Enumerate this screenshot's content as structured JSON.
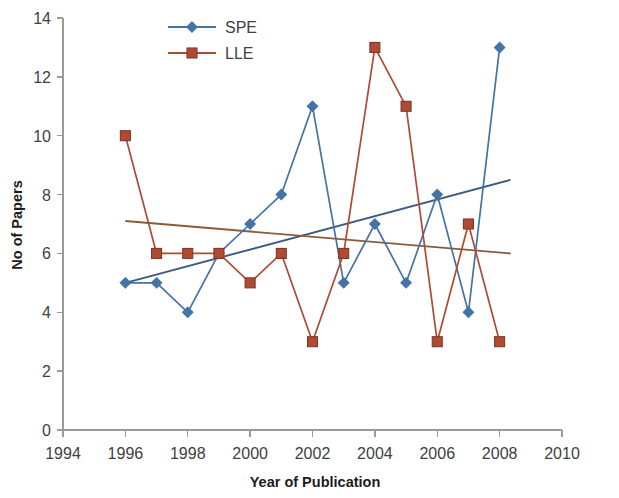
{
  "chart_data": {
    "type": "line",
    "title": "",
    "xlabel": "Year of Publication",
    "ylabel": "No of Papers",
    "x": [
      1996,
      1997,
      1998,
      1999,
      2000,
      2001,
      2002,
      2003,
      2004,
      2005,
      2006,
      2007,
      2008
    ],
    "series": [
      {
        "name": "SPE",
        "color": "#4473A6",
        "marker": "diamond",
        "values": [
          5,
          5,
          4,
          6,
          7,
          8,
          11,
          5,
          7,
          5,
          8,
          4,
          13
        ]
      },
      {
        "name": "LLE",
        "color": "#B04A33",
        "marker": "square",
        "values": [
          10,
          6,
          6,
          6,
          5,
          6,
          3,
          6,
          13,
          11,
          3,
          7,
          3
        ]
      }
    ],
    "trendlines": [
      {
        "name": "SPE trendline",
        "color": "#3D5A80",
        "x_start": 1996.0,
        "y_start": 5.0,
        "x_end": 2008.35,
        "y_end": 8.5
      },
      {
        "name": "LLE trendline",
        "color": "#8A5B3A",
        "x_start": 1996.0,
        "y_start": 7.1,
        "x_end": 2008.35,
        "y_end": 6.0
      }
    ],
    "xlim": [
      1994,
      2010
    ],
    "ylim": [
      0,
      14
    ],
    "xticks": [
      1994,
      1996,
      1998,
      2000,
      2002,
      2004,
      2006,
      2008,
      2010
    ],
    "xtick_labels": [
      "1994",
      "1996",
      "1998",
      "2000",
      "2002",
      "2004",
      "2006",
      "2008",
      "2010"
    ],
    "yticks": [
      0,
      2,
      4,
      6,
      8,
      10,
      12,
      14
    ],
    "ytick_labels": [
      "0",
      "2",
      "4",
      "6",
      "8",
      "10",
      "12",
      "14"
    ],
    "grid": false,
    "legend_position": "top-center",
    "legend": [
      {
        "label": "SPE",
        "color": "#4473A6",
        "marker": "diamond"
      },
      {
        "label": "LLE",
        "color": "#B04A33",
        "marker": "square"
      }
    ]
  }
}
